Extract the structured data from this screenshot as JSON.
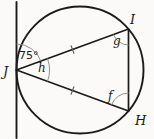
{
  "figure": {
    "kind": "circle-inscribed-triangle-with-tangent",
    "background_color": "#fbfaf8",
    "line_color": "#1b1b1b",
    "arc_color": "#8f8f8f",
    "labels": {
      "point_j": "J",
      "point_i": "I",
      "point_h": "H",
      "tangent_chord_angle": "75°",
      "angle_at_j": "h",
      "angle_at_i": "g",
      "angle_at_h": "f"
    },
    "congruence": "single tick marks on chords JI and JH"
  }
}
